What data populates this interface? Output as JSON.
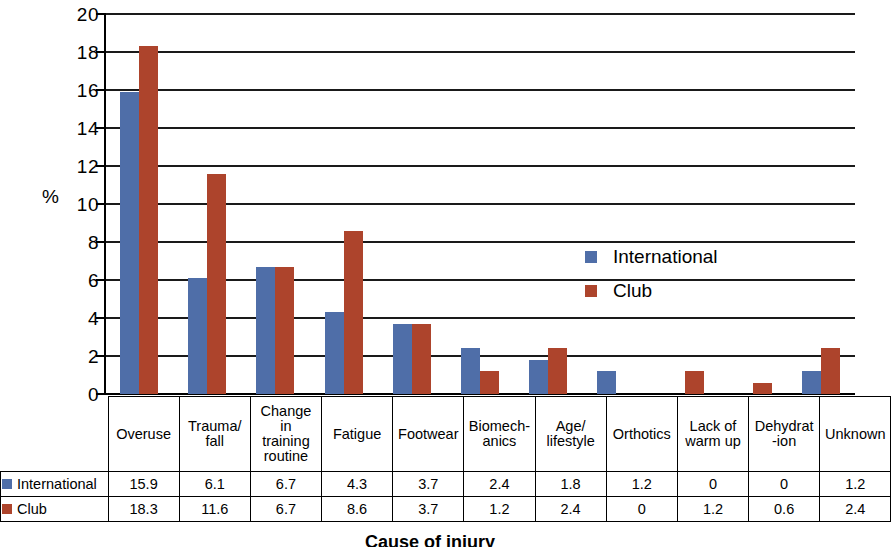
{
  "chart_data": {
    "type": "bar",
    "title": "",
    "xlabel": "Cause of injury",
    "ylabel": "%",
    "ylim": [
      0,
      20
    ],
    "yticks": [
      0,
      2,
      4,
      6,
      8,
      10,
      12,
      14,
      16,
      18,
      20
    ],
    "grid": true,
    "legend_position": "inside-right",
    "categories": [
      "Overuse",
      "Trauma/ fall",
      "Change in training routine",
      "Fatigue",
      "Footwear",
      "Biomech- anics",
      "Age/ lifestyle",
      "Orthotics",
      "Lack of warm up",
      "Dehydrat -ion",
      "Unknown"
    ],
    "category_lines": [
      [
        "Overuse"
      ],
      [
        "Trauma/",
        "fall"
      ],
      [
        "Change",
        "in",
        "training",
        "routine"
      ],
      [
        "Fatigue"
      ],
      [
        "Footwear"
      ],
      [
        "Biomech-",
        "anics"
      ],
      [
        "Age/",
        "lifestyle"
      ],
      [
        "Orthotics"
      ],
      [
        "Lack of",
        "warm up"
      ],
      [
        "Dehydrat",
        "-ion"
      ],
      [
        "Unknown"
      ]
    ],
    "series": [
      {
        "name": "International",
        "color": "#4f6ea8",
        "values": [
          15.9,
          6.1,
          6.7,
          4.3,
          3.7,
          2.4,
          1.8,
          1.2,
          0,
          0,
          1.2
        ]
      },
      {
        "name": "Club",
        "color": "#ad442c",
        "values": [
          18.3,
          11.6,
          6.7,
          8.6,
          3.7,
          1.2,
          2.4,
          0,
          1.2,
          0.6,
          2.4
        ]
      }
    ]
  },
  "legend": {
    "items": [
      {
        "label": "International",
        "color": "#4f6ea8"
      },
      {
        "label": "Club",
        "color": "#ad442c"
      }
    ]
  },
  "axis": {
    "y_title": "%"
  },
  "footer": {
    "caption": "Cause of injury"
  }
}
